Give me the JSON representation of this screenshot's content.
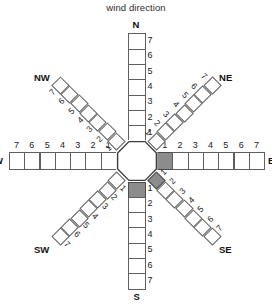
{
  "title": "wind direction",
  "colors": {
    "background": "#ffffff",
    "cell_fill": "#ffffff",
    "cell_stroke": "#5f5f5f",
    "highlight_fill": "#8c8c8c",
    "text": "#1a1a1a"
  },
  "chart_data": {
    "type": "other",
    "subtype": "wind-rose-grid",
    "title": "wind direction",
    "ring_count": 7,
    "tick_labels": [
      "1",
      "2",
      "3",
      "4",
      "5",
      "6",
      "7"
    ],
    "direction_order": [
      "N",
      "NE",
      "E",
      "SE",
      "S",
      "SW",
      "W",
      "NW"
    ],
    "series": [
      {
        "name": "N",
        "label": "N",
        "cells": 7,
        "filled_cells": []
      },
      {
        "name": "NE",
        "label": "NE",
        "cells": 7,
        "filled_cells": []
      },
      {
        "name": "E",
        "label": "E",
        "cells": 7,
        "filled_cells": [
          1
        ]
      },
      {
        "name": "SE",
        "label": "SE",
        "cells": 7,
        "filled_cells": [
          1
        ]
      },
      {
        "name": "S",
        "label": "S",
        "cells": 7,
        "filled_cells": [
          1
        ]
      },
      {
        "name": "SW",
        "label": "SW",
        "cells": 7,
        "filled_cells": []
      },
      {
        "name": "W",
        "label": "W",
        "cells": 7,
        "filled_cells": []
      },
      {
        "name": "NW",
        "label": "NW",
        "cells": 7,
        "filled_cells": []
      }
    ],
    "values": [
      0,
      0,
      1,
      1,
      1,
      0,
      0,
      0
    ],
    "categories": [
      "N",
      "NE",
      "E",
      "SE",
      "S",
      "SW",
      "W",
      "NW"
    ],
    "legend": []
  },
  "labels": {
    "n": "N",
    "ne": "NE",
    "e": "E",
    "se": "SE",
    "s": "S",
    "sw": "SW",
    "w": "W",
    "nw": "NW"
  },
  "ticks": {
    "t1": "1",
    "t2": "2",
    "t3": "3",
    "t4": "4",
    "t5": "5",
    "t6": "6",
    "t7": "7"
  }
}
